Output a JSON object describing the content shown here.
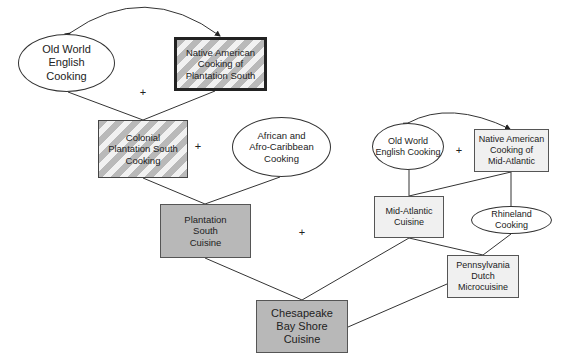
{
  "diagram": {
    "type": "culinary-lineage-flow",
    "nodes": [
      {
        "id": "old_world_english_south",
        "label": "Old World English Cooking",
        "shape": "ellipse"
      },
      {
        "id": "native_american_south",
        "label": "Native American Cooking of Plantation South",
        "shape": "rect",
        "style": "hatched-thick-border"
      },
      {
        "id": "colonial_plantation",
        "label": "Colonial Plantation South Cooking",
        "shape": "rect",
        "style": "hatched"
      },
      {
        "id": "african_caribbean",
        "label": "African and Afro-Caribbean Cooking",
        "shape": "ellipse"
      },
      {
        "id": "plantation_south_cuisine",
        "label": "Plantation South Cuisine",
        "shape": "rect",
        "style": "gray"
      },
      {
        "id": "old_world_english_midatl",
        "label": "Old World English Cooking",
        "shape": "ellipse"
      },
      {
        "id": "native_american_midatl",
        "label": "Native American Cooking of Mid-Atlantic",
        "shape": "rect",
        "style": "light"
      },
      {
        "id": "mid_atlantic_cuisine",
        "label": "Mid-Atlantic Cuisine",
        "shape": "rect",
        "style": "light"
      },
      {
        "id": "rhineland",
        "label": "Rhineland Cooking",
        "shape": "ellipse"
      },
      {
        "id": "pennsylvania_dutch",
        "label": "Pennsylvania Dutch Microcuisine",
        "shape": "rect",
        "style": "light"
      },
      {
        "id": "chesapeake",
        "label": "Chesapeake Bay Shore Cuisine",
        "shape": "rect",
        "style": "gray"
      }
    ],
    "edges": [
      {
        "from": "old_world_english_south",
        "to": "native_american_south",
        "type": "bidirectional-arc"
      },
      {
        "from": "old_world_english_south",
        "to": "colonial_plantation"
      },
      {
        "from": "native_american_south",
        "to": "colonial_plantation"
      },
      {
        "from": "colonial_plantation",
        "to": "plantation_south_cuisine"
      },
      {
        "from": "african_caribbean",
        "to": "plantation_south_cuisine"
      },
      {
        "from": "old_world_english_midatl",
        "to": "native_american_midatl",
        "type": "bidirectional-arc"
      },
      {
        "from": "old_world_english_midatl",
        "to": "mid_atlantic_cuisine"
      },
      {
        "from": "native_american_midatl",
        "to": "mid_atlantic_cuisine"
      },
      {
        "from": "native_american_midatl",
        "to": "rhineland"
      },
      {
        "from": "mid_atlantic_cuisine",
        "to": "pennsylvania_dutch"
      },
      {
        "from": "rhineland",
        "to": "pennsylvania_dutch"
      },
      {
        "from": "plantation_south_cuisine",
        "to": "chesapeake"
      },
      {
        "from": "mid_atlantic_cuisine",
        "to": "chesapeake"
      },
      {
        "from": "pennsylvania_dutch",
        "to": "chesapeake"
      }
    ],
    "plus_signs": [
      "+",
      "+",
      "+",
      "+"
    ]
  },
  "labels": {
    "n1": [
      "Old World",
      "English",
      "Cooking"
    ],
    "n2": [
      "Native American",
      "Cooking of",
      "Plantation South"
    ],
    "n3": [
      "Colonial",
      "Plantation South",
      "Cooking"
    ],
    "n4": [
      "African and",
      "Afro-Caribbean",
      "Cooking"
    ],
    "n5": [
      "Plantation",
      "South",
      "Cuisine"
    ],
    "n6": [
      "Old World",
      "English Cooking"
    ],
    "n7": [
      "Native American",
      "Cooking of",
      "Mid-Atlantic"
    ],
    "n8": [
      "Mid-Atlantic",
      "Cuisine"
    ],
    "n9": [
      "Rhineland",
      "Cooking"
    ],
    "n10": [
      "Pennsylvania",
      "Dutch",
      "Microcuisine"
    ],
    "n11": [
      "Chesapeake",
      "Bay Shore",
      "Cuisine"
    ]
  },
  "plus": "+"
}
